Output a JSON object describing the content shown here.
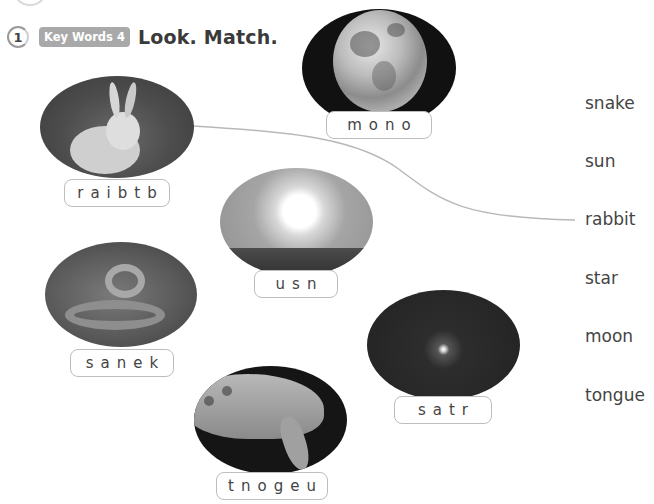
{
  "exercise": {
    "number": "1",
    "badge": "Key Words 4",
    "instruction": "Look. Match."
  },
  "pictures": [
    {
      "id": "moon",
      "subject": "moon-photo",
      "scrambled": "mono"
    },
    {
      "id": "rabbit",
      "subject": "rabbit-photo",
      "scrambled": "raibtb"
    },
    {
      "id": "sun",
      "subject": "sun-photo",
      "scrambled": "usn"
    },
    {
      "id": "snake",
      "subject": "snake-photo",
      "scrambled": "sanek"
    },
    {
      "id": "star",
      "subject": "star-photo",
      "scrambled": "satr"
    },
    {
      "id": "tongue",
      "subject": "tongue-photo",
      "scrambled": "tnogeu"
    }
  ],
  "words": [
    "snake",
    "sun",
    "rabbit",
    "star",
    "moon",
    "tongue"
  ],
  "matches": [
    {
      "from": "rabbit",
      "to": "rabbit",
      "line_color": "#b8b8b8"
    }
  ]
}
